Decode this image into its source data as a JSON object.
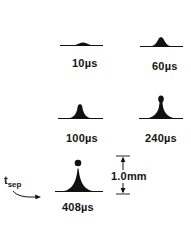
{
  "figure": {
    "panels": [
      {
        "id": "p1",
        "label": "10µs",
        "time_us": 10
      },
      {
        "id": "p2",
        "label": "60µs",
        "time_us": 60
      },
      {
        "id": "p3",
        "label": "100µs",
        "time_us": 100
      },
      {
        "id": "p4",
        "label": "240µs",
        "time_us": 240
      },
      {
        "id": "p5",
        "label": "408µs",
        "time_us": 408
      }
    ],
    "scale_bar": {
      "label": "1.0mm"
    },
    "separation_marker": {
      "symbol": "t",
      "subscript": "sep"
    },
    "colors": {
      "ink": "#111111",
      "background": "#ffffff"
    }
  }
}
